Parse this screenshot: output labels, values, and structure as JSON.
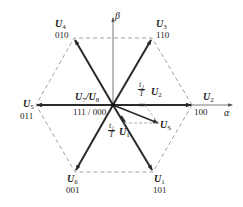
{
  "diagram": {
    "type": "space-vector-hexagon",
    "colors": {
      "vector": "#2a2a2a",
      "dashed": "#888888",
      "axis": "#555555",
      "background": "#ffffff"
    },
    "axes": {
      "alpha": "α",
      "beta": "β"
    },
    "vectors": [
      {
        "name": "U",
        "sub": "1",
        "code": "101"
      },
      {
        "name": "U",
        "sub": "2",
        "code": "100"
      },
      {
        "name": "U",
        "sub": "3",
        "code": "110"
      },
      {
        "name": "U",
        "sub": "4",
        "code": "010"
      },
      {
        "name": "U",
        "sub": "5",
        "code": "011"
      },
      {
        "name": "U",
        "sub": "6",
        "code": "001"
      }
    ],
    "zero_vectors": {
      "label_a": "U",
      "sub_a": "7",
      "sep": "/",
      "label_b": "U",
      "sub_b": "8",
      "code": "111 / 000"
    },
    "reference": {
      "name": "U",
      "sub": "S"
    },
    "components": {
      "t2": {
        "num": "t₂",
        "den": "T",
        "vec": "U",
        "sub": "2"
      },
      "t1": {
        "num": "t₁",
        "den": "T",
        "vec": "U",
        "sub": "1"
      }
    }
  }
}
